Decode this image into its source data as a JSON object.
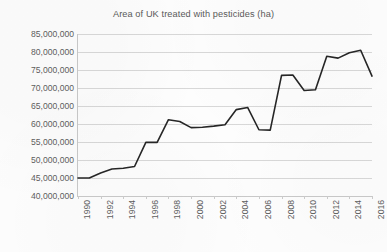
{
  "chart_data": {
    "type": "line",
    "title": "Area of UK treated with pesticides (ha)",
    "xlabel": "",
    "ylabel": "",
    "ylim": [
      40000000,
      85000000
    ],
    "ytick_step": 5000000,
    "ytick_labels": [
      "85,000,000",
      "80,000,000",
      "75,000,000",
      "70,000,000",
      "65,000,000",
      "60,000,000",
      "55,000,000",
      "50,000,000",
      "45,000,000",
      "40,000,000"
    ],
    "xlim": [
      1990,
      2016
    ],
    "xtick_labels": [
      "1990",
      "1992",
      "1994",
      "1996",
      "1998",
      "2000",
      "2002",
      "2004",
      "2006",
      "2008",
      "2010",
      "2012",
      "2014",
      "2016"
    ],
    "xtick_interval": 2,
    "grid": "horizontal",
    "legend": "none",
    "line_color": "#262626",
    "line_width": 1.6,
    "markers": "none",
    "x": [
      1990,
      1991,
      1992,
      1993,
      1994,
      1995,
      1996,
      1997,
      1998,
      1999,
      2000,
      2001,
      2002,
      2003,
      2004,
      2005,
      2006,
      2007,
      2008,
      2009,
      2010,
      2011,
      2012,
      2013,
      2014,
      2015,
      2016
    ],
    "values": [
      45000000,
      45000000,
      46400000,
      47500000,
      47700000,
      48200000,
      54900000,
      54900000,
      61200000,
      60700000,
      59000000,
      59100000,
      59400000,
      59800000,
      64000000,
      64600000,
      58400000,
      58300000,
      73500000,
      73600000,
      69300000,
      69500000,
      78800000,
      78300000,
      79800000,
      80500000,
      73300000
    ]
  }
}
